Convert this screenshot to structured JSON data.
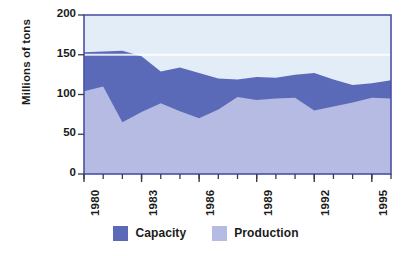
{
  "chart_data": {
    "type": "area",
    "title": "",
    "subtitle": "",
    "xlabel": "",
    "ylabel": "Millions of tons",
    "xlim": [
      1980,
      1996
    ],
    "ylim": [
      0,
      200
    ],
    "grid": false,
    "stacked": false,
    "legend_position": "bottom",
    "x": [
      1980,
      1981,
      1982,
      1983,
      1984,
      1985,
      1986,
      1987,
      1988,
      1989,
      1990,
      1991,
      1992,
      1993,
      1994,
      1995,
      1996
    ],
    "xtick_labels": [
      "1980",
      "1983",
      "1986",
      "1989",
      "1992",
      "1995"
    ],
    "xtick_values": [
      1980,
      1983,
      1986,
      1989,
      1992,
      1995
    ],
    "ytick_labels": [
      "0",
      "50",
      "100",
      "150",
      "200"
    ],
    "ytick_values": [
      0,
      50,
      100,
      150,
      200
    ],
    "series": [
      {
        "name": "Capacity",
        "color": "#5a6ab8",
        "values": [
          153,
          154,
          155,
          148,
          129,
          134,
          127,
          120,
          119,
          122,
          121,
          125,
          127,
          119,
          112,
          114,
          118
        ]
      },
      {
        "name": "Production",
        "color": "#b5bbe2",
        "values": [
          104,
          110,
          65,
          78,
          89,
          79,
          70,
          81,
          97,
          93,
          95,
          96,
          80,
          85,
          90,
          96,
          95
        ]
      }
    ],
    "plot_background": "#e3edf7",
    "border_color": "#4a51a8"
  },
  "legend": {
    "items": [
      {
        "label": "Capacity",
        "color": "#5a6ab8"
      },
      {
        "label": "Production",
        "color": "#b5bbe2"
      }
    ]
  },
  "axis": {
    "y_title": "Millions of tons"
  }
}
